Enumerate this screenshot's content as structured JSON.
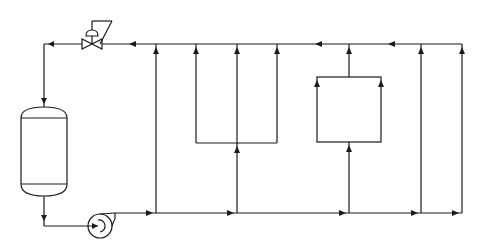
{
  "diagram": {
    "type": "process-flow",
    "colors": {
      "line": "#1a1a1a",
      "background": "#ffffff"
    },
    "components": {
      "vessel": {
        "name": "vertical-vessel",
        "x": 21,
        "y": 107,
        "width": 46,
        "height": 89
      },
      "pump": {
        "name": "centrifugal-pump",
        "cx": 100,
        "cy": 226,
        "r": 12
      },
      "control_valve": {
        "name": "control-valve",
        "cx": 92,
        "cy": 44
      },
      "loop_u": {
        "name": "u-loop",
        "x1": 196,
        "x2": 277,
        "y_bottom": 143
      },
      "box": {
        "name": "exchanger-box",
        "x": 317,
        "y": 77,
        "width": 64,
        "height": 65
      }
    },
    "lines": {
      "supply_header_y": 213,
      "return_header_y": 44,
      "risers_x": [
        156,
        237,
        349,
        421,
        462
      ]
    }
  }
}
